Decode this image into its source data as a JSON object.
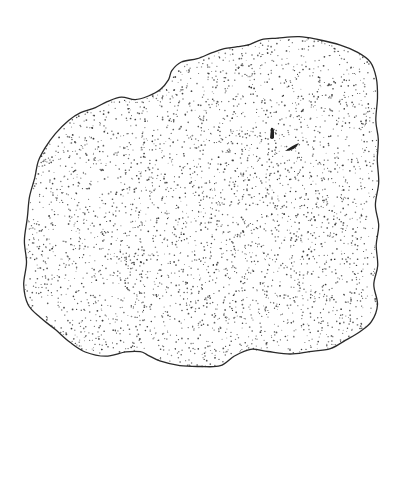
{
  "image": {
    "subject": "stipple illustration of a rounded, lobed flat organism outline",
    "background": "#ffffff",
    "ink": "#2a2a2a",
    "outline": [
      [
        300,
        36
      ],
      [
        318,
        40
      ],
      [
        340,
        45
      ],
      [
        358,
        52
      ],
      [
        370,
        62
      ],
      [
        376,
        78
      ],
      [
        377,
        98
      ],
      [
        376,
        120
      ],
      [
        378,
        140
      ],
      [
        377,
        160
      ],
      [
        378,
        182
      ],
      [
        376,
        205
      ],
      [
        378,
        225
      ],
      [
        376,
        245
      ],
      [
        377,
        265
      ],
      [
        374,
        285
      ],
      [
        377,
        305
      ],
      [
        372,
        322
      ],
      [
        360,
        332
      ],
      [
        345,
        340
      ],
      [
        330,
        348
      ],
      [
        310,
        352
      ],
      [
        290,
        354
      ],
      [
        268,
        352
      ],
      [
        250,
        350
      ],
      [
        235,
        356
      ],
      [
        220,
        365
      ],
      [
        200,
        367
      ],
      [
        180,
        366
      ],
      [
        160,
        361
      ],
      [
        148,
        355
      ],
      [
        140,
        352
      ],
      [
        125,
        352
      ],
      [
        105,
        356
      ],
      [
        85,
        352
      ],
      [
        70,
        342
      ],
      [
        55,
        330
      ],
      [
        40,
        318
      ],
      [
        28,
        305
      ],
      [
        24,
        285
      ],
      [
        26,
        262
      ],
      [
        25,
        240
      ],
      [
        28,
        218
      ],
      [
        30,
        198
      ],
      [
        34,
        178
      ],
      [
        38,
        162
      ],
      [
        45,
        148
      ],
      [
        56,
        133
      ],
      [
        68,
        120
      ],
      [
        80,
        112
      ],
      [
        95,
        108
      ],
      [
        108,
        102
      ],
      [
        122,
        98
      ],
      [
        135,
        100
      ],
      [
        148,
        96
      ],
      [
        160,
        90
      ],
      [
        168,
        80
      ],
      [
        172,
        70
      ],
      [
        182,
        62
      ],
      [
        198,
        58
      ],
      [
        212,
        52
      ],
      [
        225,
        48
      ],
      [
        238,
        46
      ],
      [
        250,
        44
      ],
      [
        262,
        40
      ],
      [
        278,
        38
      ]
    ],
    "stipple_count": 3600,
    "marks": [
      {
        "name": "small-dark-mark-1",
        "cx": 273,
        "cy": 134
      },
      {
        "name": "small-dark-mark-2",
        "cx": 293,
        "cy": 147
      }
    ]
  }
}
